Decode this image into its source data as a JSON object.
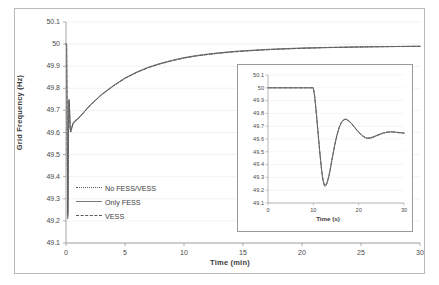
{
  "figure": {
    "background_color": "#ffffff",
    "frame_color": "#b8b8b8"
  },
  "chart_data": {
    "type": "line",
    "title": "",
    "xlabel": "Time (min)",
    "ylabel": "Grid Frequency (Hz)",
    "xlim": [
      0,
      30
    ],
    "ylim": [
      49.1,
      50.1
    ],
    "xticks": [
      "0",
      "5",
      "10",
      "15",
      "20",
      "25",
      "30"
    ],
    "yticks": [
      "49.1",
      "49.2",
      "49.3",
      "49.4",
      "49.5",
      "49.6",
      "49.7",
      "49.8",
      "49.9",
      "50",
      "50.1"
    ],
    "grid": true,
    "legend_position": "lower-left",
    "legend": [
      {
        "label": "No FESS/VESS",
        "style": "dotted",
        "color": "#5a5a5a"
      },
      {
        "label": "Only FESS",
        "style": "solid",
        "color": "#7a7a7a"
      },
      {
        "label": "VESS",
        "style": "dashed",
        "color": "#5a5a5a"
      }
    ],
    "series": [
      {
        "name": "No FESS/VESS",
        "style": "dotted",
        "color": "#5a5a5a",
        "x": [
          0.0,
          0.05,
          0.1,
          0.15,
          0.18,
          0.21,
          0.25,
          0.3,
          0.35,
          0.4,
          0.5,
          0.6,
          0.8,
          1.0,
          1.5,
          2.0,
          3.0,
          4.0,
          5.0,
          6.0,
          7.0,
          8.0,
          9.0,
          10.0,
          11.0,
          12.0,
          13.0,
          14.0,
          15.0,
          16.0,
          17.0,
          18.0,
          19.0,
          20.0,
          21.0,
          22.0,
          23.0,
          24.0,
          25.0,
          26.0,
          27.0,
          28.0,
          29.0,
          30.0
        ],
        "y": [
          50.0,
          50.0,
          49.55,
          49.21,
          49.33,
          49.58,
          49.74,
          49.7,
          49.62,
          49.6,
          49.62,
          49.64,
          49.65,
          49.66,
          49.69,
          49.72,
          49.77,
          49.81,
          49.845,
          49.872,
          49.894,
          49.911,
          49.925,
          49.937,
          49.946,
          49.953,
          49.959,
          49.964,
          49.968,
          49.9715,
          49.9745,
          49.977,
          49.979,
          49.981,
          49.9825,
          49.984,
          49.985,
          49.986,
          49.987,
          49.9878,
          49.9885,
          49.989,
          49.9895,
          49.99
        ]
      },
      {
        "name": "Only FESS",
        "style": "solid",
        "color": "#7a7a7a",
        "x": [
          0.0,
          0.05,
          0.1,
          0.15,
          0.18,
          0.21,
          0.25,
          0.3,
          0.35,
          0.4,
          0.5,
          0.6,
          0.8,
          1.0,
          1.5,
          2.0,
          3.0,
          4.0,
          5.0,
          6.0,
          7.0,
          8.0,
          9.0,
          10.0,
          11.0,
          12.0,
          13.0,
          14.0,
          15.0,
          16.0,
          17.0,
          18.0,
          19.0,
          20.0,
          21.0,
          22.0,
          23.0,
          24.0,
          25.0,
          26.0,
          27.0,
          28.0,
          29.0,
          30.0
        ],
        "y": [
          50.0,
          50.0,
          49.58,
          49.24,
          49.36,
          49.6,
          49.75,
          49.71,
          49.63,
          49.61,
          49.625,
          49.645,
          49.655,
          49.662,
          49.692,
          49.722,
          49.772,
          49.812,
          49.847,
          49.874,
          49.896,
          49.913,
          49.927,
          49.939,
          49.948,
          49.955,
          49.961,
          49.966,
          49.97,
          49.973,
          49.976,
          49.9785,
          49.9805,
          49.9822,
          49.9836,
          49.9848,
          49.9858,
          49.9866,
          49.9873,
          49.988,
          49.9886,
          49.9891,
          49.9896,
          49.99
        ]
      },
      {
        "name": "VESS",
        "style": "dashed",
        "color": "#5a5a5a",
        "x": [
          0.0,
          0.05,
          0.1,
          0.15,
          0.18,
          0.21,
          0.25,
          0.3,
          0.35,
          0.4,
          0.5,
          0.6,
          0.8,
          1.0,
          1.5,
          2.0,
          3.0,
          4.0,
          5.0,
          6.0,
          7.0,
          8.0,
          9.0,
          10.0,
          11.0,
          12.0,
          13.0,
          14.0,
          15.0,
          16.0,
          17.0,
          18.0,
          19.0,
          20.0,
          21.0,
          22.0,
          23.0,
          24.0,
          25.0,
          26.0,
          27.0,
          28.0,
          29.0,
          30.0
        ],
        "y": [
          50.0,
          50.0,
          49.56,
          49.225,
          49.345,
          49.59,
          49.745,
          49.705,
          49.625,
          49.605,
          49.622,
          49.642,
          49.652,
          49.66,
          49.69,
          49.72,
          49.77,
          49.81,
          49.845,
          49.872,
          49.894,
          49.911,
          49.925,
          49.937,
          49.946,
          49.953,
          49.959,
          49.964,
          49.968,
          49.9715,
          49.9745,
          49.977,
          49.979,
          49.981,
          49.9825,
          49.984,
          49.985,
          49.986,
          49.987,
          49.9878,
          49.9885,
          49.989,
          49.9895,
          49.99
        ]
      }
    ]
  },
  "inset_chart": {
    "type": "line",
    "title": "",
    "xlabel": "Time (s)",
    "ylabel": "",
    "xlim": [
      0,
      30
    ],
    "ylim": [
      49.1,
      50.1
    ],
    "xticks": [
      "0",
      "10",
      "20",
      "30"
    ],
    "yticks": [
      "49.1",
      "49.2",
      "49.3",
      "49.4",
      "49.5",
      "49.6",
      "49.7",
      "49.8",
      "49.9",
      "50",
      "50.1"
    ],
    "grid": true,
    "series": [
      {
        "name": "No FESS/VESS",
        "style": "dotted",
        "color": "#5a5a5a",
        "x": [
          0.0,
          2.0,
          4.0,
          6.0,
          8.0,
          9.5,
          10.0,
          10.3,
          10.7,
          11.0,
          11.4,
          11.8,
          12.1,
          12.4,
          12.7,
          13.0,
          13.4,
          13.8,
          14.2,
          14.7,
          15.2,
          15.7,
          16.2,
          16.7,
          17.1,
          17.5,
          18.0,
          18.5,
          19.0,
          19.5,
          20.0,
          20.5,
          21.0,
          21.5,
          22.0,
          22.5,
          23.0,
          23.5,
          24.0,
          24.5,
          25.0,
          25.5,
          26.0,
          26.5,
          27.0,
          27.5,
          28.0,
          28.5,
          29.0,
          29.5,
          30.0
        ],
        "y": [
          50.0,
          50.0,
          50.0,
          50.0,
          50.0,
          50.0,
          50.0,
          49.93,
          49.78,
          49.66,
          49.5,
          49.36,
          49.28,
          49.235,
          49.23,
          49.25,
          49.3,
          49.37,
          49.45,
          49.545,
          49.625,
          49.687,
          49.727,
          49.748,
          49.752,
          49.748,
          49.735,
          49.716,
          49.694,
          49.672,
          49.652,
          49.635,
          49.619,
          49.608,
          49.604,
          49.605,
          49.61,
          49.617,
          49.625,
          49.632,
          49.639,
          49.645,
          49.65,
          49.653,
          49.654,
          49.654,
          49.652,
          49.65,
          49.648,
          49.646,
          49.645
        ]
      },
      {
        "name": "Only FESS",
        "style": "solid",
        "color": "#7a7a7a",
        "x": [
          0.0,
          2.0,
          4.0,
          6.0,
          8.0,
          9.5,
          10.0,
          10.3,
          10.7,
          11.0,
          11.4,
          11.8,
          12.1,
          12.4,
          12.7,
          13.0,
          13.4,
          13.8,
          14.2,
          14.7,
          15.2,
          15.7,
          16.2,
          16.7,
          17.1,
          17.5,
          18.0,
          18.5,
          19.0,
          19.5,
          20.0,
          20.5,
          21.0,
          21.5,
          22.0,
          22.5,
          23.0,
          23.5,
          24.0,
          24.5,
          25.0,
          25.5,
          26.0,
          26.5,
          27.0,
          27.5,
          28.0,
          28.5,
          29.0,
          29.5,
          30.0
        ],
        "y": [
          50.0,
          50.0,
          50.0,
          50.0,
          50.0,
          50.0,
          50.0,
          49.935,
          49.79,
          49.67,
          49.51,
          49.37,
          49.29,
          49.245,
          49.24,
          49.26,
          49.31,
          49.38,
          49.46,
          49.553,
          49.632,
          49.693,
          49.732,
          49.752,
          49.756,
          49.751,
          49.738,
          49.719,
          49.697,
          49.675,
          49.655,
          49.638,
          49.623,
          49.612,
          49.608,
          49.61,
          49.615,
          49.622,
          49.63,
          49.637,
          49.643,
          49.649,
          49.653,
          49.656,
          49.657,
          49.657,
          49.655,
          49.653,
          49.651,
          49.649,
          49.648
        ]
      },
      {
        "name": "VESS",
        "style": "dashed",
        "color": "#5a5a5a",
        "x": [
          0.0,
          2.0,
          4.0,
          6.0,
          8.0,
          9.5,
          10.0,
          10.3,
          10.7,
          11.0,
          11.4,
          11.8,
          12.1,
          12.4,
          12.7,
          13.0,
          13.4,
          13.8,
          14.2,
          14.7,
          15.2,
          15.7,
          16.2,
          16.7,
          17.1,
          17.5,
          18.0,
          18.5,
          19.0,
          19.5,
          20.0,
          20.5,
          21.0,
          21.5,
          22.0,
          22.5,
          23.0,
          23.5,
          24.0,
          24.5,
          25.0,
          25.5,
          26.0,
          26.5,
          27.0,
          27.5,
          28.0,
          28.5,
          29.0,
          29.5,
          30.0
        ],
        "y": [
          50.0,
          50.0,
          50.0,
          50.0,
          50.0,
          50.0,
          50.0,
          49.932,
          49.785,
          49.665,
          49.505,
          49.365,
          49.285,
          49.24,
          49.235,
          49.255,
          49.305,
          49.375,
          49.455,
          49.549,
          49.628,
          49.69,
          49.729,
          49.75,
          49.754,
          49.749,
          49.736,
          49.717,
          49.695,
          49.673,
          49.653,
          49.636,
          49.621,
          49.61,
          49.606,
          49.607,
          49.612,
          49.619,
          49.627,
          49.634,
          49.641,
          49.647,
          49.651,
          49.654,
          49.655,
          49.655,
          49.653,
          49.651,
          49.649,
          49.647,
          49.646
        ]
      }
    ]
  }
}
